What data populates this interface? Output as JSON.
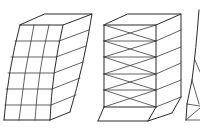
{
  "diagram": {
    "description": "Line drawings of building deformation modes under lateral load",
    "background": "#ffffff",
    "stroke_color": "#2a2a2a",
    "figures": [
      {
        "id": "shear-frame",
        "label": "Rigid frame (shear/flexural sway)",
        "storeys": 6,
        "bays": 3,
        "deformation": "curved sway to the left, base fixed"
      },
      {
        "id": "braced-frame",
        "label": "Braced frame (X-bracing, racking at base storey)",
        "storeys": 5,
        "bracing": "X",
        "deformation": "upper storeys rigid, ground storey sheared"
      },
      {
        "id": "truss-tower",
        "label": "Triangulated tower (partially visible)",
        "deformation": "cropped at right edge"
      }
    ]
  }
}
